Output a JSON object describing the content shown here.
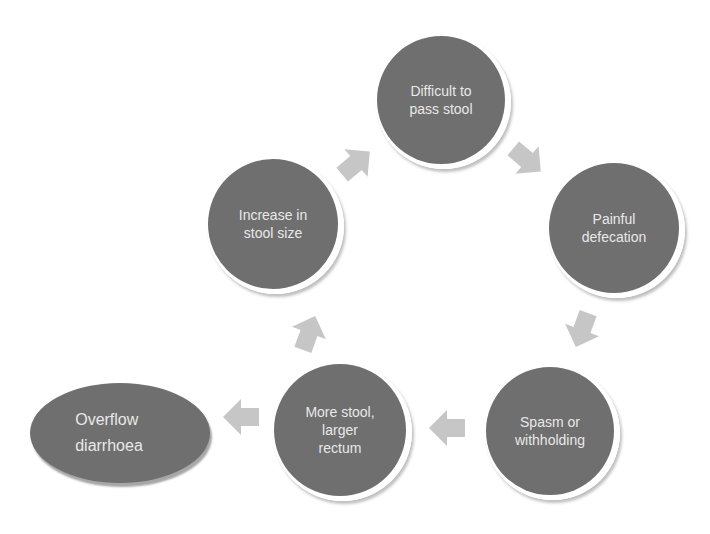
{
  "diagram": {
    "type": "cycle",
    "colors": {
      "node_fill": "#6f6f6f",
      "node_text": "#e8e8e8",
      "arrow_fill": "#c6c6c6",
      "background": "#ffffff"
    },
    "nodes": [
      {
        "id": "difficult",
        "label": "Difficult to\npass stool",
        "shape": "circle",
        "cx": 441,
        "cy": 100,
        "r": 64
      },
      {
        "id": "painful",
        "label": "Painful\ndefecation",
        "shape": "circle",
        "cx": 614,
        "cy": 228,
        "r": 65
      },
      {
        "id": "spasm",
        "label": "Spasm or\nwithholding",
        "shape": "circle",
        "cx": 550,
        "cy": 431,
        "r": 64
      },
      {
        "id": "more_stool",
        "label": "More stool,\nlarger\nrectum",
        "shape": "circle",
        "cx": 340,
        "cy": 430,
        "r": 66
      },
      {
        "id": "increase",
        "label": "Increase in\nstool size",
        "shape": "circle",
        "cx": 273,
        "cy": 224,
        "r": 65
      },
      {
        "id": "overflow",
        "label": "Overflow\ndiarrhoea",
        "shape": "ellipse",
        "cx": 120,
        "cy": 433,
        "rx": 90,
        "ry": 50
      }
    ],
    "edges": [
      {
        "from": "difficult",
        "to": "painful",
        "x": 527,
        "y": 160,
        "angle": 40
      },
      {
        "from": "painful",
        "to": "spasm",
        "x": 582,
        "y": 330,
        "angle": 110
      },
      {
        "from": "spasm",
        "to": "more_stool",
        "x": 447,
        "y": 428,
        "angle": 180
      },
      {
        "from": "more_stool",
        "to": "increase",
        "x": 309,
        "y": 333,
        "angle": -70
      },
      {
        "from": "increase",
        "to": "difficult",
        "x": 356,
        "y": 163,
        "angle": -40
      },
      {
        "from": "more_stool",
        "to": "overflow",
        "x": 241,
        "y": 417,
        "angle": 180
      }
    ]
  }
}
